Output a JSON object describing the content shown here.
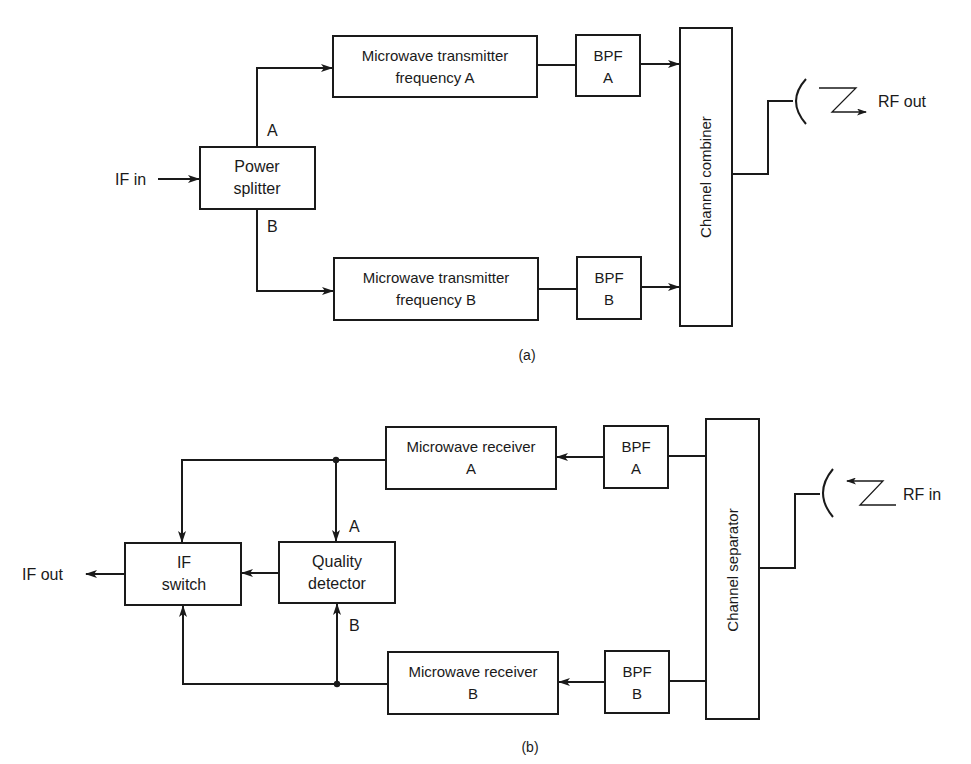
{
  "figure_a": {
    "caption": "(a)",
    "input_label": "IF in",
    "output_label": "RF out",
    "power_splitter": {
      "line1": "Power",
      "line2": "splitter"
    },
    "branch_a_label": "A",
    "branch_b_label": "B",
    "transmitter_a": {
      "line1": "Microwave transmitter",
      "line2": "frequency A"
    },
    "transmitter_b": {
      "line1": "Microwave transmitter",
      "line2": "frequency B"
    },
    "bpf_a": {
      "line1": "BPF",
      "line2": "A"
    },
    "bpf_b": {
      "line1": "BPF",
      "line2": "B"
    },
    "combiner": "Channel combiner"
  },
  "figure_b": {
    "caption": "(b)",
    "input_label": "RF in",
    "output_label": "IF out",
    "separator": "Channel separator",
    "bpf_a": {
      "line1": "BPF",
      "line2": "A"
    },
    "bpf_b": {
      "line1": "BPF",
      "line2": "B"
    },
    "receiver_a": {
      "line1": "Microwave receiver",
      "line2": "A"
    },
    "receiver_b": {
      "line1": "Microwave receiver",
      "line2": "B"
    },
    "quality_detector": {
      "line1": "Quality",
      "line2": "detector"
    },
    "if_switch": {
      "line1": "IF",
      "line2": "switch"
    },
    "detector_input_a_label": "A",
    "detector_input_b_label": "B"
  }
}
